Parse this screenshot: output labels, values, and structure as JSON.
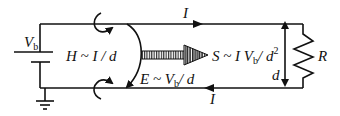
{
  "diagram": {
    "type": "circuit / field diagram",
    "labels": {
      "battery_voltage": "V",
      "battery_voltage_sub": "b",
      "magnetic_field": "H ~ I / d",
      "electric_field_main": "E ~ V",
      "electric_field_sub": "b",
      "electric_field_tail": "/ d",
      "poynting_main": "S ~ I V",
      "poynting_sub": "b",
      "poynting_tail": "/ d",
      "poynting_sup": "2",
      "current_top": "I",
      "current_bottom": "I",
      "separation": "d",
      "resistor": "R"
    },
    "elements": [
      "battery",
      "ground",
      "top-wire",
      "bottom-wire",
      "resistor",
      "separation-arrow",
      "magnetic-field-loop-top",
      "magnetic-field-loop-bottom",
      "electric-field-arc",
      "poynting-vector-arrow",
      "current-arrow-top",
      "current-arrow-bottom"
    ],
    "colors": {
      "ink": "#111111",
      "background": "#ffffff"
    }
  }
}
